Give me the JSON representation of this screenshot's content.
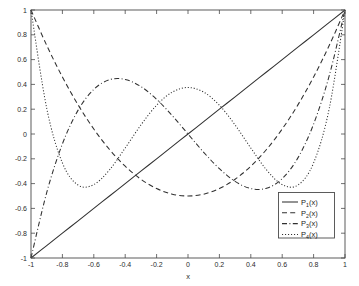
{
  "chart_data": {
    "type": "line",
    "title": "",
    "subtitle": "",
    "xlabel": "x",
    "ylabel": "",
    "xlim": [
      -1,
      1
    ],
    "ylim": [
      -1,
      1
    ],
    "grid": false,
    "legend_position": "lower-right",
    "xticks": [
      -1,
      -0.8,
      -0.6,
      -0.4,
      -0.2,
      0,
      0.2,
      0.4,
      0.6,
      0.8,
      1
    ],
    "yticks": [
      -1,
      -0.8,
      -0.6,
      -0.4,
      -0.2,
      0,
      0.2,
      0.4,
      0.6,
      0.8,
      1
    ],
    "xticklabels": [
      "-1",
      "-0.8",
      "-0.6",
      "-0.4",
      "-0.2",
      "0",
      "0.2",
      "0.4",
      "0.6",
      "0.8",
      "1"
    ],
    "yticklabels": [
      "-1",
      "-0.8",
      "-0.6",
      "-0.4",
      "-0.2",
      "0",
      "0.2",
      "0.4",
      "0.6",
      "0.8",
      "1"
    ],
    "series": [
      {
        "name": "P_1(x)",
        "label_base": "P",
        "label_sub": "1",
        "label_tail": "(x)",
        "linestyle": "solid",
        "color": "#303030",
        "x": [
          -1,
          -0.9,
          -0.8,
          -0.7,
          -0.6,
          -0.5,
          -0.4,
          -0.3,
          -0.2,
          -0.1,
          0,
          0.1,
          0.2,
          0.3,
          0.4,
          0.5,
          0.6,
          0.7,
          0.8,
          0.9,
          1
        ],
        "values": [
          -1,
          -0.9,
          -0.8,
          -0.7,
          -0.6,
          -0.5,
          -0.4,
          -0.3,
          -0.2,
          -0.1,
          0,
          0.1,
          0.2,
          0.3,
          0.4,
          0.5,
          0.6,
          0.7,
          0.8,
          0.9,
          1
        ]
      },
      {
        "name": "P_2(x)",
        "label_base": "P",
        "label_sub": "2",
        "label_tail": "(x)",
        "linestyle": "dashed",
        "color": "#303030",
        "x": [
          -1,
          -0.9,
          -0.8,
          -0.7,
          -0.6,
          -0.5,
          -0.4,
          -0.3,
          -0.2,
          -0.1,
          0,
          0.1,
          0.2,
          0.3,
          0.4,
          0.5,
          0.6,
          0.7,
          0.8,
          0.9,
          1
        ],
        "values": [
          1,
          0.715,
          0.46,
          0.235,
          0.04,
          -0.125,
          -0.26,
          -0.365,
          -0.44,
          -0.485,
          -0.5,
          -0.485,
          -0.44,
          -0.365,
          -0.26,
          -0.125,
          0.04,
          0.235,
          0.46,
          0.715,
          1
        ]
      },
      {
        "name": "P_3(x)",
        "label_base": "P",
        "label_sub": "3",
        "label_tail": "(x)",
        "linestyle": "dashdot",
        "color": "#303030",
        "x": [
          -1,
          -0.9,
          -0.8,
          -0.7,
          -0.6,
          -0.5,
          -0.4,
          -0.3,
          -0.2,
          -0.1,
          0,
          0.1,
          0.2,
          0.3,
          0.4,
          0.5,
          0.6,
          0.7,
          0.8,
          0.9,
          1
        ],
        "values": [
          -1,
          -0.4725,
          -0.08,
          0.1925,
          0.36,
          0.4375,
          0.44,
          0.3825,
          0.28,
          0.1475,
          0,
          -0.1475,
          -0.28,
          -0.3825,
          -0.44,
          -0.4375,
          -0.36,
          -0.1925,
          0.08,
          0.4725,
          1
        ]
      },
      {
        "name": "P_4(x)",
        "label_base": "P",
        "label_sub": "4",
        "label_tail": "(x)",
        "linestyle": "dotted",
        "color": "#303030",
        "x": [
          -1,
          -0.9,
          -0.8,
          -0.7,
          -0.6,
          -0.5,
          -0.4,
          -0.3,
          -0.2,
          -0.1,
          0,
          0.1,
          0.2,
          0.3,
          0.4,
          0.5,
          0.6,
          0.7,
          0.8,
          0.9,
          1
        ],
        "values": [
          1,
          0.2079,
          -0.233,
          -0.4121,
          -0.408,
          -0.2891,
          -0.113,
          0.0729,
          0.232,
          0.3379,
          0.375,
          0.3379,
          0.232,
          0.0729,
          -0.113,
          -0.2891,
          -0.408,
          -0.4121,
          -0.233,
          0.2079,
          1
        ]
      }
    ]
  },
  "axes": {
    "xlabel": "x"
  }
}
